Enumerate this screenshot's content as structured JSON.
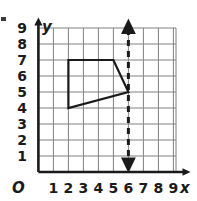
{
  "figure": {
    "origin_label": "O",
    "x_axis_label": "x",
    "y_axis_label": "y",
    "x_tick_labels": [
      "1",
      "2",
      "3",
      "4",
      "5",
      "6",
      "7",
      "8",
      "9"
    ],
    "y_tick_labels": [
      "1",
      "2",
      "3",
      "4",
      "5",
      "6",
      "7",
      "8",
      "9"
    ],
    "colors": {
      "grid": "#808080",
      "axis": "#1a1a1a",
      "shape_stroke": "#1a1a1a",
      "dashed_line": "#1a1a1a",
      "background": "#ffffff"
    }
  },
  "chart_data": {
    "type": "scatter",
    "title": "",
    "xlabel": "x",
    "ylabel": "y",
    "xlim": [
      0,
      9
    ],
    "ylim": [
      0,
      9
    ],
    "grid": true,
    "legend": "none",
    "x_ticks": [
      1,
      2,
      3,
      4,
      5,
      6,
      7,
      8,
      9
    ],
    "y_ticks": [
      1,
      2,
      3,
      4,
      5,
      6,
      7,
      8,
      9
    ],
    "series": [
      {
        "name": "quadrilateral",
        "type": "polygon",
        "closed": true,
        "points": [
          [
            2,
            7
          ],
          [
            5,
            7
          ],
          [
            6,
            5
          ],
          [
            2,
            4
          ]
        ],
        "stroke": "#1a1a1a",
        "fill": "none"
      },
      {
        "name": "line-of-reflection",
        "type": "vertical-dashed-line",
        "x": 6,
        "y_from": 0,
        "y_to": 9.4,
        "arrows": "both",
        "stroke": "#1a1a1a"
      }
    ]
  }
}
